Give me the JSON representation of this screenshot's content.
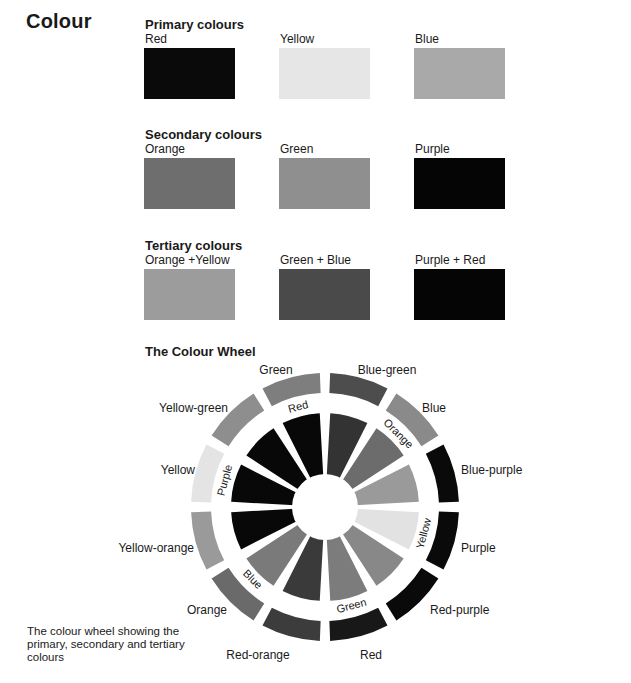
{
  "page": {
    "title": "Colour",
    "primary": {
      "heading": "Primary colours",
      "items": [
        {
          "label": "Red",
          "color": "#0a0a0a"
        },
        {
          "label": "Yellow",
          "color": "#e6e6e6"
        },
        {
          "label": "Blue",
          "color": "#a9a9a9"
        }
      ]
    },
    "secondary": {
      "heading": "Secondary colours",
      "items": [
        {
          "label": "Orange",
          "color": "#6e6e6e"
        },
        {
          "label": "Green",
          "color": "#8f8f8f"
        },
        {
          "label": "Purple",
          "color": "#050505"
        }
      ]
    },
    "tertiary": {
      "heading": "Tertiary colours",
      "items": [
        {
          "label": "Orange +Yellow",
          "color": "#9c9c9c"
        },
        {
          "label": "Green + Blue",
          "color": "#4a4a4a"
        },
        {
          "label": "Purple + Red",
          "color": "#050505"
        }
      ]
    },
    "wheel": {
      "heading": "The Colour Wheel",
      "outer_segments": [
        {
          "label": "Blue-green",
          "color": "#4d4d4d"
        },
        {
          "label": "Blue",
          "color": "#8a8a8a"
        },
        {
          "label": "Blue-purple",
          "color": "#0a0a0a"
        },
        {
          "label": "Purple",
          "color": "#0a0a0a"
        },
        {
          "label": "Red-purple",
          "color": "#0a0a0a"
        },
        {
          "label": "Red",
          "color": "#181818"
        },
        {
          "label": "Red-orange",
          "color": "#3c3c3c"
        },
        {
          "label": "Orange",
          "color": "#6a6a6a"
        },
        {
          "label": "Yellow-orange",
          "color": "#9a9a9a"
        },
        {
          "label": "Yellow",
          "color": "#e4e4e4"
        },
        {
          "label": "Yellow-green",
          "color": "#8e8e8e"
        },
        {
          "label": "Green",
          "color": "#7e7e7e"
        }
      ],
      "inner_segments": [
        {
          "color": "#333333"
        },
        {
          "color": "#6c6c6c"
        },
        {
          "color": "#9a9a9a"
        },
        {
          "color": "#e2e2e2"
        },
        {
          "color": "#888888"
        },
        {
          "color": "#7c7c7c"
        },
        {
          "color": "#3a3a3a"
        },
        {
          "color": "#7a7a7a"
        },
        {
          "color": "#080808"
        },
        {
          "color": "#080808"
        },
        {
          "color": "#080808"
        },
        {
          "color": "#080808"
        }
      ],
      "inner_labels": [
        {
          "text": "Red"
        },
        {
          "text": "Orange"
        },
        {
          "text": "Yellow"
        },
        {
          "text": "Green"
        },
        {
          "text": "Blue"
        },
        {
          "text": "Purple"
        }
      ]
    },
    "caption": "The colour wheel showing the primary, secondary and tertiary colours"
  }
}
